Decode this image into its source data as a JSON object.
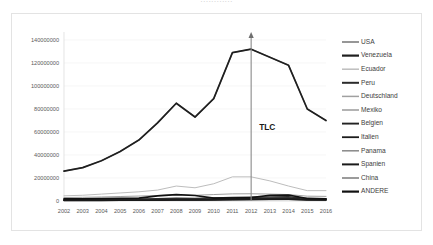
{
  "top_edge_text": "............",
  "annotation": {
    "label": "TLC",
    "at_category": "2012",
    "icon": "up-arrow-icon"
  },
  "chart_data": {
    "type": "line",
    "title": "",
    "xlabel": "",
    "ylabel": "",
    "ylim": [
      0,
      140000000
    ],
    "yticks": [
      0,
      20000000,
      40000000,
      60000000,
      80000000,
      100000000,
      120000000,
      140000000
    ],
    "ytick_labels": [
      "0",
      "20000000",
      "40000000",
      "60000000",
      "80000000",
      "100000000",
      "120000000",
      "140000000"
    ],
    "grid": true,
    "legend_position": "right",
    "categories": [
      "2002",
      "2003",
      "2004",
      "2005",
      "2006",
      "2007",
      "2008",
      "2009",
      "2010",
      "2011",
      "2012",
      "2013",
      "2014",
      "2015",
      "2016"
    ],
    "series": [
      {
        "name": "USA",
        "color": "#8c8c8c",
        "width": 1.3,
        "values": [
          26000000,
          29000000,
          35000000,
          43000000,
          53000000,
          68000000,
          85000000,
          73000000,
          89000000,
          129000000,
          132000000,
          125000000,
          118000000,
          80000000,
          70000000
        ]
      },
      {
        "name": "Venezuela",
        "color": "#1f1f1f",
        "width": 1.7,
        "values": [
          26000000,
          29000000,
          35000000,
          43000000,
          53000000,
          68000000,
          85000000,
          73000000,
          89000000,
          129000000,
          132000000,
          125000000,
          118000000,
          80000000,
          70000000
        ]
      },
      {
        "name": "Ecuador",
        "color": "#bdbdbd",
        "width": 1.0,
        "values": [
          4500000,
          5000000,
          6000000,
          7000000,
          8000000,
          9500000,
          13000000,
          11500000,
          15000000,
          21000000,
          21000000,
          17500000,
          13000000,
          9000000,
          9000000
        ]
      },
      {
        "name": "Peru",
        "color": "#2b2b2b",
        "width": 1.5,
        "values": [
          1200000,
          1300000,
          1400000,
          1500000,
          1700000,
          1900000,
          2400000,
          2200000,
          2600000,
          3000000,
          3200000,
          3400000,
          3600000,
          2200000,
          1900000
        ]
      },
      {
        "name": "Deutschland",
        "color": "#a0a0a0",
        "width": 1.0,
        "values": [
          3000000,
          3200000,
          3500000,
          3900000,
          4300000,
          4800000,
          5600000,
          5000000,
          5600000,
          6200000,
          6300000,
          6000000,
          5600000,
          4200000,
          4000000
        ]
      },
      {
        "name": "Mexiko",
        "color": "#9a9a9a",
        "width": 1.0,
        "values": [
          900000,
          950000,
          1000000,
          1100000,
          1200000,
          1300000,
          1600000,
          1400000,
          1600000,
          1900000,
          2000000,
          2100000,
          2200000,
          1500000,
          1400000
        ]
      },
      {
        "name": "Belgien",
        "color": "#232323",
        "width": 1.4,
        "values": [
          700000,
          750000,
          800000,
          850000,
          950000,
          1100000,
          1400000,
          1200000,
          1500000,
          1800000,
          2000000,
          2400000,
          2600000,
          1500000,
          1200000
        ]
      },
      {
        "name": "Italien",
        "color": "#1c1c1c",
        "width": 1.3,
        "values": [
          600000,
          650000,
          700000,
          750000,
          850000,
          950000,
          1200000,
          1050000,
          1300000,
          1600000,
          1800000,
          2100000,
          2300000,
          1300000,
          1100000
        ]
      },
      {
        "name": "Panama",
        "color": "#888888",
        "width": 1.0,
        "values": [
          500000,
          550000,
          600000,
          650000,
          700000,
          800000,
          1000000,
          900000,
          1100000,
          1300000,
          1400000,
          1600000,
          1700000,
          1000000,
          900000
        ]
      },
      {
        "name": "Spanien",
        "color": "#1a1a1a",
        "width": 1.5,
        "values": [
          450000,
          480000,
          520000,
          560000,
          620000,
          700000,
          900000,
          800000,
          950000,
          1150000,
          1250000,
          1450000,
          1550000,
          900000,
          800000
        ]
      },
      {
        "name": "China",
        "color": "#7a7a7a",
        "width": 1.0,
        "values": [
          300000,
          330000,
          360000,
          400000,
          450000,
          520000,
          650000,
          580000,
          700000,
          850000,
          950000,
          1100000,
          1200000,
          700000,
          650000
        ]
      },
      {
        "name": "ANDERE",
        "color": "#111111",
        "width": 1.7,
        "values": [
          1800000,
          1900000,
          2000000,
          2200000,
          2500000,
          4500000,
          5500000,
          4800000,
          2500000,
          2600000,
          3000000,
          5000000,
          5200000,
          2200000,
          1800000
        ]
      }
    ]
  }
}
